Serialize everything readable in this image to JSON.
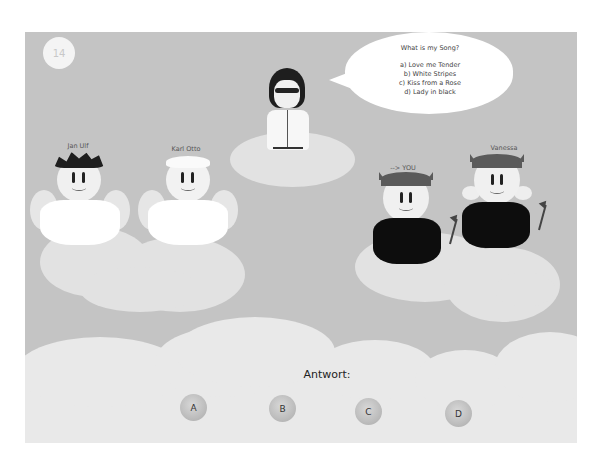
{
  "game": {
    "round_number": "14",
    "speech_bubble": {
      "question": "What is my Song?",
      "options": [
        "a) Love me Tender",
        "b) White Stripes",
        "c) Kiss from a Rose",
        "d) Lady in black"
      ]
    },
    "players": [
      {
        "name": "Jan Ulf",
        "role": "angel"
      },
      {
        "name": "Karl Otto",
        "role": "angel"
      },
      {
        "name": "--> YOU",
        "role": "devil"
      },
      {
        "name": "Vanessa",
        "role": "devil"
      }
    ],
    "answer": {
      "label": "Antwort:",
      "buttons": [
        "A",
        "B",
        "C",
        "D"
      ]
    }
  },
  "colors": {
    "sky": "#c4c4c4",
    "cloud": "#e2e2e2",
    "bubble": "#ffffff",
    "devil_shirt": "#0d0d0d",
    "angel_shirt": "#ffffff"
  }
}
